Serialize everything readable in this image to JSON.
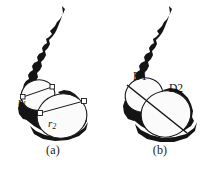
{
  "figure": {
    "width": 213,
    "height": 171,
    "background_color": "#ffffff",
    "ink_color": "#111111",
    "silhouette_color": "#141414",
    "circle_fill": "#fbfbfb",
    "circle_stroke": "#1a1a1a"
  },
  "panels": [
    {
      "id": "a",
      "caption": "(a)",
      "measurement_type": "radius",
      "labels": [
        {
          "name": "r1",
          "base": "r",
          "subscript": "1"
        },
        {
          "name": "r2",
          "base": "r",
          "subscript": "2"
        }
      ],
      "circles": [
        {
          "name": "small-circle",
          "cx": 38,
          "cy": 95,
          "r": 16
        },
        {
          "name": "large-circle",
          "cx": 62,
          "cy": 116,
          "r": 24
        }
      ]
    },
    {
      "id": "b",
      "caption": "(b)",
      "measurement_type": "diameter",
      "labels": [
        {
          "name": "D1",
          "base": "D1",
          "subscript": ""
        },
        {
          "name": "D2",
          "base": "D2",
          "subscript": ""
        }
      ],
      "circles": [
        {
          "name": "upper-circle",
          "cx": 38,
          "cy": 94,
          "r": 18
        },
        {
          "name": "lower-circle",
          "cx": 60,
          "cy": 114,
          "r": 25
        }
      ]
    }
  ],
  "annotations": {
    "r1_text": "r",
    "r1_sub": "1",
    "r2_text": "r",
    "r2_sub": "2",
    "d1_text": "D1",
    "d2_text": "D2",
    "caption_a": "(a)",
    "caption_b": "(b)"
  }
}
